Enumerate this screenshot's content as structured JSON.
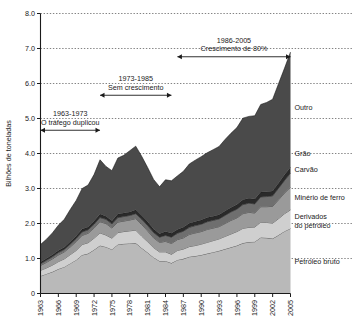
{
  "chart_data": {
    "type": "area",
    "stacked": true,
    "title": "",
    "xlabel": "",
    "ylabel": "Bilhões de toneladas",
    "ylim": [
      0,
      8.0
    ],
    "xlim": [
      1963,
      2005
    ],
    "grid": true,
    "legend_position": "right-inline",
    "ytick_labels": [
      "0",
      "1.0",
      "2.0",
      "3.0",
      "4.0",
      "5.0",
      "6.0",
      "7.0",
      "8.0"
    ],
    "ytick_values": [
      0,
      1.0,
      2.0,
      3.0,
      4.0,
      5.0,
      6.0,
      7.0,
      8.0
    ],
    "xtick_labels": [
      "1963",
      "1966",
      "1969",
      "1972",
      "1975",
      "1978",
      "1981",
      "1984",
      "1987",
      "1990",
      "1993",
      "1996",
      "1999",
      "2002",
      "2005"
    ],
    "xtick_values": [
      1963,
      1966,
      1969,
      1972,
      1975,
      1978,
      1981,
      1984,
      1987,
      1990,
      1993,
      1996,
      1999,
      2002,
      2005
    ],
    "x": [
      1963,
      1964,
      1965,
      1966,
      1967,
      1968,
      1969,
      1970,
      1971,
      1972,
      1973,
      1974,
      1975,
      1976,
      1977,
      1978,
      1979,
      1980,
      1981,
      1982,
      1983,
      1984,
      1985,
      1986,
      1987,
      1988,
      1989,
      1990,
      1991,
      1992,
      1993,
      1994,
      1995,
      1996,
      1997,
      1998,
      1999,
      2000,
      2001,
      2002,
      2003,
      2004,
      2005
    ],
    "series": [
      {
        "name": "Petróleo bruto",
        "color": "#b9b9b9",
        "values": [
          0.5,
          0.56,
          0.62,
          0.7,
          0.76,
          0.86,
          0.96,
          1.1,
          1.14,
          1.25,
          1.37,
          1.33,
          1.26,
          1.4,
          1.42,
          1.43,
          1.44,
          1.3,
          1.17,
          1.03,
          0.93,
          0.93,
          0.87,
          0.96,
          0.99,
          1.05,
          1.07,
          1.1,
          1.14,
          1.18,
          1.22,
          1.27,
          1.32,
          1.37,
          1.44,
          1.47,
          1.48,
          1.6,
          1.59,
          1.57,
          1.67,
          1.78,
          1.86
        ]
      },
      {
        "name": "Derivados do petróleo",
        "color": "#cfcfcf",
        "values": [
          0.16,
          0.17,
          0.19,
          0.21,
          0.23,
          0.25,
          0.27,
          0.3,
          0.31,
          0.33,
          0.36,
          0.34,
          0.32,
          0.34,
          0.35,
          0.36,
          0.37,
          0.34,
          0.31,
          0.28,
          0.26,
          0.26,
          0.25,
          0.27,
          0.28,
          0.29,
          0.3,
          0.31,
          0.32,
          0.33,
          0.34,
          0.36,
          0.38,
          0.4,
          0.42,
          0.42,
          0.42,
          0.44,
          0.44,
          0.44,
          0.47,
          0.5,
          0.53
        ]
      },
      {
        "name": "Minério de ferro",
        "color": "#9a9a9a",
        "values": [
          0.14,
          0.16,
          0.18,
          0.19,
          0.2,
          0.22,
          0.25,
          0.26,
          0.27,
          0.29,
          0.32,
          0.33,
          0.29,
          0.3,
          0.3,
          0.31,
          0.33,
          0.33,
          0.31,
          0.28,
          0.27,
          0.3,
          0.31,
          0.31,
          0.32,
          0.35,
          0.36,
          0.36,
          0.37,
          0.36,
          0.35,
          0.37,
          0.39,
          0.39,
          0.42,
          0.43,
          0.4,
          0.44,
          0.45,
          0.48,
          0.54,
          0.59,
          0.65
        ]
      },
      {
        "name": "Carvão",
        "color": "#6f6f6f",
        "values": [
          0.05,
          0.06,
          0.06,
          0.07,
          0.07,
          0.08,
          0.09,
          0.1,
          0.1,
          0.11,
          0.12,
          0.12,
          0.12,
          0.13,
          0.13,
          0.13,
          0.14,
          0.15,
          0.15,
          0.15,
          0.15,
          0.17,
          0.18,
          0.18,
          0.19,
          0.2,
          0.21,
          0.21,
          0.22,
          0.22,
          0.22,
          0.23,
          0.24,
          0.25,
          0.26,
          0.26,
          0.26,
          0.28,
          0.29,
          0.3,
          0.33,
          0.36,
          0.4
        ]
      },
      {
        "name": "Grão",
        "color": "#2a2a2a",
        "values": [
          0.05,
          0.05,
          0.06,
          0.06,
          0.06,
          0.07,
          0.07,
          0.08,
          0.08,
          0.09,
          0.1,
          0.09,
          0.09,
          0.1,
          0.1,
          0.1,
          0.11,
          0.11,
          0.11,
          0.1,
          0.1,
          0.11,
          0.11,
          0.11,
          0.11,
          0.12,
          0.12,
          0.12,
          0.12,
          0.12,
          0.12,
          0.13,
          0.13,
          0.13,
          0.14,
          0.14,
          0.14,
          0.14,
          0.14,
          0.14,
          0.15,
          0.16,
          0.17
        ]
      },
      {
        "name": "Outro",
        "color": "#4a4a4a",
        "values": [
          0.5,
          0.55,
          0.62,
          0.72,
          0.8,
          0.92,
          1.02,
          1.16,
          1.2,
          1.33,
          1.55,
          1.42,
          1.43,
          1.6,
          1.65,
          1.75,
          1.82,
          1.69,
          1.55,
          1.42,
          1.34,
          1.48,
          1.5,
          1.53,
          1.6,
          1.69,
          1.75,
          1.81,
          1.85,
          1.9,
          1.95,
          2.04,
          2.12,
          2.2,
          2.33,
          2.34,
          2.38,
          2.5,
          2.55,
          2.62,
          2.84,
          3.05,
          3.29
        ]
      }
    ],
    "annotations": [
      {
        "id": "annot-1963-1973",
        "line1": "1963-1973",
        "line2": "O tráfego duplicou",
        "x_start": 1963,
        "x_end": 1973,
        "y": 4.75
      },
      {
        "id": "annot-1973-1985",
        "line1": "1973-1985",
        "line2": "Sem crescimento",
        "x_start": 1973,
        "x_end": 1985,
        "y": 5.75
      },
      {
        "id": "annot-1986-2005",
        "line1": "1986-2005",
        "line2": "Crescimento de 80%",
        "x_start": 1986,
        "x_end": 2005,
        "y": 6.85
      }
    ]
  }
}
